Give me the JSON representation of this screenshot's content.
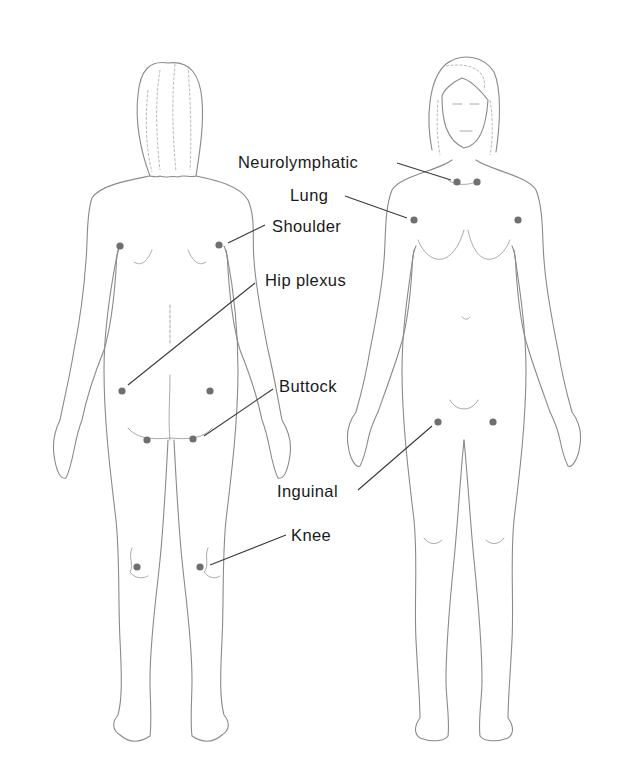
{
  "colors": {
    "point": "#6f6f6f",
    "leader": "#3a3a3a",
    "outline": "#8a8a8a",
    "label": "#1a1a1a"
  },
  "figures": [
    {
      "id": "back",
      "view": "posterior"
    },
    {
      "id": "front",
      "view": "anterior"
    }
  ],
  "labels": [
    {
      "id": "neurolymphatic",
      "text": "Neurolymphatic",
      "figure": "front"
    },
    {
      "id": "lung",
      "text": "Lung",
      "figure": "front"
    },
    {
      "id": "shoulder",
      "text": "Shoulder",
      "figure": "back"
    },
    {
      "id": "hip-plexus",
      "text": "Hip plexus",
      "figure": "back"
    },
    {
      "id": "buttock",
      "text": "Buttock",
      "figure": "back"
    },
    {
      "id": "inguinal",
      "text": "Inguinal",
      "figure": "front"
    },
    {
      "id": "knee",
      "text": "Knee",
      "figure": "back"
    }
  ],
  "points": [
    {
      "label": "shoulder",
      "figure": "back",
      "side": "left"
    },
    {
      "label": "shoulder",
      "figure": "back",
      "side": "right"
    },
    {
      "label": "hip-plexus",
      "figure": "back",
      "side": "left"
    },
    {
      "label": "hip-plexus",
      "figure": "back",
      "side": "right"
    },
    {
      "label": "buttock",
      "figure": "back",
      "side": "left"
    },
    {
      "label": "buttock",
      "figure": "back",
      "side": "right"
    },
    {
      "label": "knee",
      "figure": "back",
      "side": "left"
    },
    {
      "label": "knee",
      "figure": "back",
      "side": "right"
    },
    {
      "label": "neurolymphatic",
      "figure": "front",
      "side": "left"
    },
    {
      "label": "neurolymphatic",
      "figure": "front",
      "side": "right"
    },
    {
      "label": "lung",
      "figure": "front",
      "side": "left"
    },
    {
      "label": "lung",
      "figure": "front",
      "side": "right"
    },
    {
      "label": "inguinal",
      "figure": "front",
      "side": "left"
    },
    {
      "label": "inguinal",
      "figure": "front",
      "side": "right"
    }
  ]
}
